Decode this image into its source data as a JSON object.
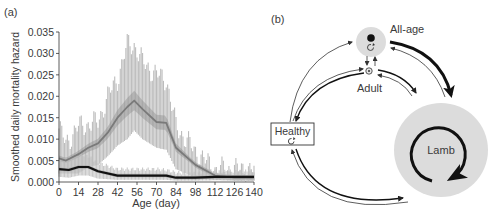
{
  "panel_a": {
    "label": "(a)",
    "chart_data": {
      "type": "line",
      "title": "",
      "xlabel": "Age (day)",
      "ylabel": "Smoothed daily mortality hazard",
      "xlim": [
        0,
        140
      ],
      "ylim": [
        0,
        0.035
      ],
      "xticks": [
        0,
        14,
        28,
        42,
        56,
        70,
        84,
        98,
        112,
        126,
        140
      ],
      "yticks": [
        "0.000",
        "0.005",
        "0.010",
        "0.015",
        "0.020",
        "0.025",
        "0.030",
        "0.035"
      ],
      "grid": false,
      "legend": null,
      "series": [
        {
          "name": "gray-mean",
          "color": "#7a7a7a",
          "x": [
            0,
            5,
            14,
            21,
            28,
            35,
            42,
            49,
            54,
            60,
            70,
            77,
            84,
            98,
            112,
            126,
            140
          ],
          "y": [
            0.0055,
            0.005,
            0.0065,
            0.008,
            0.009,
            0.0115,
            0.015,
            0.0175,
            0.019,
            0.017,
            0.014,
            0.0138,
            0.008,
            0.004,
            0.0015,
            0.001,
            0.001
          ],
          "band_upper": [
            0.0125,
            0.009,
            0.013,
            0.0135,
            0.014,
            0.02,
            0.024,
            0.032,
            0.032,
            0.028,
            0.025,
            0.024,
            0.013,
            0.007,
            0.003,
            0.003,
            0.003
          ],
          "band_lower": [
            0.002,
            0.002,
            0.002,
            0.0035,
            0.004,
            0.006,
            0.0085,
            0.01,
            0.012,
            0.01,
            0.008,
            0.0075,
            0.003,
            0.001,
            0.0005,
            0.0003,
            0.0003
          ]
        },
        {
          "name": "black-mean",
          "color": "#111111",
          "x": [
            0,
            7,
            14,
            21,
            28,
            42,
            56,
            70,
            77,
            84,
            98,
            112,
            126,
            140
          ],
          "y": [
            0.003,
            0.0028,
            0.0035,
            0.0035,
            0.0025,
            0.0015,
            0.0015,
            0.0015,
            0.0015,
            0.001,
            0.001,
            0.0012,
            0.0012,
            0.0012
          ],
          "band_upper": [
            0.005,
            0.0055,
            0.0065,
            0.006,
            0.0045,
            0.003,
            0.003,
            0.003,
            0.0028,
            0.0022,
            0.002,
            0.0025,
            0.0025,
            0.0025
          ],
          "band_lower": [
            0.0012,
            0.001,
            0.0015,
            0.0015,
            0.0008,
            0.0005,
            0.0005,
            0.0005,
            0.0005,
            0.0003,
            0.0003,
            0.0004,
            0.0004,
            0.0004
          ]
        }
      ]
    }
  },
  "panel_b": {
    "label": "(b)",
    "nodes": {
      "all_age": "All-age",
      "adult": "Adult",
      "healthy": "Healthy",
      "lamb": "Lamb"
    }
  }
}
